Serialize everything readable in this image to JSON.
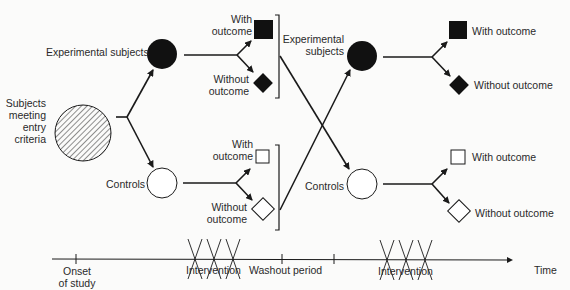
{
  "diagram": {
    "type": "crossover-study-design",
    "start": {
      "label_lines": [
        "Subjects",
        "meeting",
        "entry",
        "criteria"
      ]
    },
    "period1": {
      "experimental": {
        "label": "Experimental subjects"
      },
      "controls": {
        "label": "Controls"
      },
      "exp_with": {
        "label_lines": [
          "With",
          "outcome"
        ]
      },
      "exp_without": {
        "label_lines": [
          "Without",
          "outcome"
        ]
      },
      "ctl_with": {
        "label_lines": [
          "With",
          "outcome"
        ]
      },
      "ctl_without": {
        "label_lines": [
          "Without",
          "outcome"
        ]
      }
    },
    "period2": {
      "experimental": {
        "label_lines": [
          "Experimental",
          "subjects"
        ]
      },
      "controls": {
        "label": "Controls"
      },
      "exp_with": {
        "label": "With outcome"
      },
      "exp_without": {
        "label": "Without outcome"
      },
      "ctl_with": {
        "label": "With outcome"
      },
      "ctl_without": {
        "label": "Without outcome"
      }
    },
    "timeline": {
      "onset": {
        "label_lines": [
          "Onset",
          "of study"
        ]
      },
      "intervention1": {
        "label": "Intervention"
      },
      "washout": {
        "label": "Washout period"
      },
      "intervention2": {
        "label": "Intervention"
      },
      "axis": {
        "label": "Time"
      }
    },
    "colors": {
      "ink": "#1a1a1a",
      "background": "#fbfbfa"
    }
  }
}
